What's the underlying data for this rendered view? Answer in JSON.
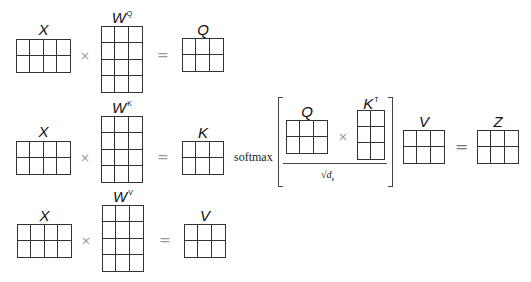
{
  "rows": [
    {
      "input": {
        "label": "X",
        "cols": 4,
        "rows": 2
      },
      "weight": {
        "label": "W",
        "superscript": "Q",
        "cols": 3,
        "rows": 4
      },
      "output": {
        "label": "Q",
        "cols": 3,
        "rows": 2
      }
    },
    {
      "input": {
        "label": "X",
        "cols": 4,
        "rows": 2
      },
      "weight": {
        "label": "W",
        "superscript": "K",
        "cols": 3,
        "rows": 4
      },
      "output": {
        "label": "K",
        "cols": 3,
        "rows": 2
      }
    },
    {
      "input": {
        "label": "X",
        "cols": 4,
        "rows": 2
      },
      "weight": {
        "label": "W",
        "superscript": "V",
        "cols": 3,
        "rows": 4
      },
      "output": {
        "label": "V",
        "cols": 3,
        "rows": 2
      }
    }
  ],
  "operators": {
    "times": "×",
    "equals": "="
  },
  "attention": {
    "function": "softmax",
    "numerator_left": {
      "label": "Q",
      "cols": 3,
      "rows": 2
    },
    "numerator_right": {
      "label": "K",
      "superscript": "T",
      "cols": 2,
      "rows": 3
    },
    "denominator": "√d",
    "denominator_subscript": "k",
    "value": {
      "label": "V",
      "cols": 3,
      "rows": 2
    },
    "result": {
      "label": "Z",
      "cols": 3,
      "rows": 2
    }
  }
}
